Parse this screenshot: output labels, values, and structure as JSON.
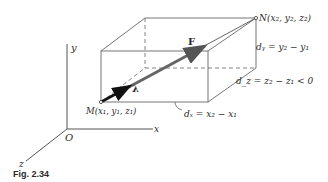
{
  "figure": {
    "caption": "Fig. 2.34",
    "axes": {
      "x": "x",
      "y": "y",
      "z": "z",
      "origin": "O"
    },
    "points": {
      "M": "M(x₁, y₁, z₁)",
      "N": "N(x₂, y₂, z₂)"
    },
    "vectors": {
      "force": "F",
      "unit": "λ"
    },
    "dimensions": {
      "dx": "dₓ = x₂ − x₁",
      "dy": "dᵧ = y₂ − y₁",
      "dz": "d_z = z₂ − z₁ < 0"
    },
    "colors": {
      "line": "#555555",
      "force": "#555555",
      "unit": "#111111"
    }
  }
}
